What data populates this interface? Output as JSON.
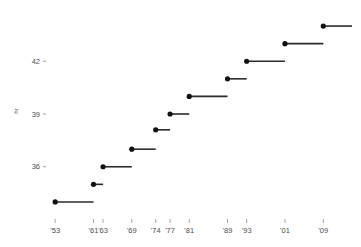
{
  "chart_data": {
    "type": "line",
    "subtype": "step-horizontal-segments",
    "title": "",
    "subtitle": "",
    "xlabel": "",
    "ylabel": "hr",
    "xtick_labels": [
      "'53",
      "'61",
      "'63",
      "'69",
      "'74",
      "'77",
      "'81",
      "'89",
      "'93",
      "'01",
      "'09"
    ],
    "xtick_values": [
      1953,
      1961,
      1963,
      1969,
      1974,
      1977,
      1981,
      1989,
      1993,
      2001,
      2009
    ],
    "ytick_labels": [
      "36",
      "39",
      "42"
    ],
    "ytick_values": [
      36,
      39,
      42
    ],
    "ylim": [
      33.2,
      44.8
    ],
    "xlim": [
      1951.5,
      2015
    ],
    "grid": false,
    "legend": null,
    "categories": [
      "'53",
      "'61",
      "'63",
      "'69",
      "'74",
      "'77",
      "'81",
      "'89",
      "'93",
      "'01",
      "'09"
    ],
    "values": [
      34.0,
      35.0,
      36.0,
      37.0,
      38.1,
      39.0,
      40.0,
      41.0,
      42.0,
      43.0,
      44.0
    ],
    "segments": [
      {
        "label": "'53",
        "x_start": 1953,
        "x_end": 1961,
        "value": 34.0
      },
      {
        "label": "'61",
        "x_start": 1961,
        "x_end": 1963,
        "value": 35.0
      },
      {
        "label": "'63",
        "x_start": 1963,
        "x_end": 1969,
        "value": 36.0
      },
      {
        "label": "'69",
        "x_start": 1969,
        "x_end": 1974,
        "value": 37.0
      },
      {
        "label": "'74",
        "x_start": 1974,
        "x_end": 1977,
        "value": 38.1
      },
      {
        "label": "'77",
        "x_start": 1977,
        "x_end": 1981,
        "value": 39.0
      },
      {
        "label": "'81",
        "x_start": 1981,
        "x_end": 1989,
        "value": 40.0
      },
      {
        "label": "'89",
        "x_start": 1989,
        "x_end": 1993,
        "value": 41.0
      },
      {
        "label": "'93",
        "x_start": 1993,
        "x_end": 2001,
        "value": 42.0
      },
      {
        "label": "'01",
        "x_start": 2001,
        "x_end": 2009,
        "value": 43.0
      },
      {
        "label": "'09",
        "x_start": 2009,
        "x_end": 2015,
        "value": 44.0
      }
    ],
    "colors": {
      "line": "#2b2b2b",
      "marker": "#111111",
      "tick_text": "#4d4d4d",
      "tick_mark": "#8c8c8c",
      "background": "#ffffff"
    }
  }
}
